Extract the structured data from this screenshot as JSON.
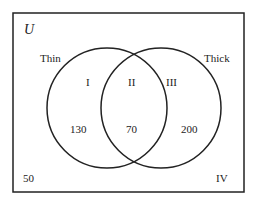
{
  "diagram": {
    "universe_label": "U",
    "sets": [
      {
        "name": "Thin",
        "label": "Thin"
      },
      {
        "name": "Thick",
        "label": "Thick"
      }
    ],
    "regions": {
      "I": {
        "label": "I",
        "value": "130"
      },
      "II": {
        "label": "II",
        "value": "70"
      },
      "III": {
        "label": "III",
        "value": "200"
      },
      "IV": {
        "label": "IV",
        "value": "50"
      }
    },
    "colors": {
      "stroke": "#222222",
      "background": "#ffffff"
    }
  }
}
